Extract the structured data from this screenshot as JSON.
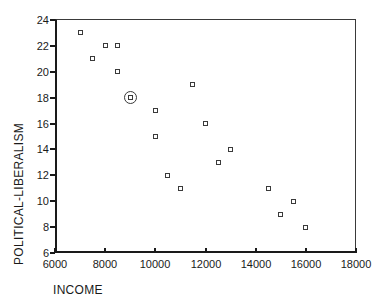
{
  "figure": {
    "background": "#ffffff",
    "axis_color": "#1a1a1a",
    "box_color": "#3a3a3a",
    "marker_color": "#3a3a3a",
    "text_color": "#1a1a1a"
  },
  "chart_data": {
    "type": "scatter",
    "title": "",
    "xlabel": "INCOME",
    "ylabel": "POLITICAL-LIBERALISM",
    "xlim": [
      6000,
      18000
    ],
    "ylim": [
      6,
      24
    ],
    "x_ticks": [
      6000,
      8000,
      10000,
      12000,
      14000,
      16000,
      18000
    ],
    "y_ticks": [
      6,
      8,
      10,
      12,
      14,
      16,
      18,
      20,
      22,
      24
    ],
    "grid": false,
    "legend": "none",
    "marker_style": "open-square",
    "highlight_style": "circled",
    "points": [
      {
        "x": 7000,
        "y": 23,
        "circled": false
      },
      {
        "x": 7500,
        "y": 21,
        "circled": false
      },
      {
        "x": 8000,
        "y": 22,
        "circled": false
      },
      {
        "x": 8500,
        "y": 22,
        "circled": false
      },
      {
        "x": 8500,
        "y": 20,
        "circled": false
      },
      {
        "x": 9000,
        "y": 18,
        "circled": true
      },
      {
        "x": 10000,
        "y": 17,
        "circled": false
      },
      {
        "x": 10000,
        "y": 15,
        "circled": false
      },
      {
        "x": 10500,
        "y": 12,
        "circled": false
      },
      {
        "x": 11000,
        "y": 11,
        "circled": false
      },
      {
        "x": 11500,
        "y": 19,
        "circled": false
      },
      {
        "x": 12000,
        "y": 16,
        "circled": false
      },
      {
        "x": 12500,
        "y": 13,
        "circled": false
      },
      {
        "x": 13000,
        "y": 14,
        "circled": false
      },
      {
        "x": 14500,
        "y": 11,
        "circled": false
      },
      {
        "x": 15000,
        "y": 9,
        "circled": false
      },
      {
        "x": 15500,
        "y": 10,
        "circled": false
      },
      {
        "x": 16000,
        "y": 8,
        "circled": false
      }
    ]
  }
}
